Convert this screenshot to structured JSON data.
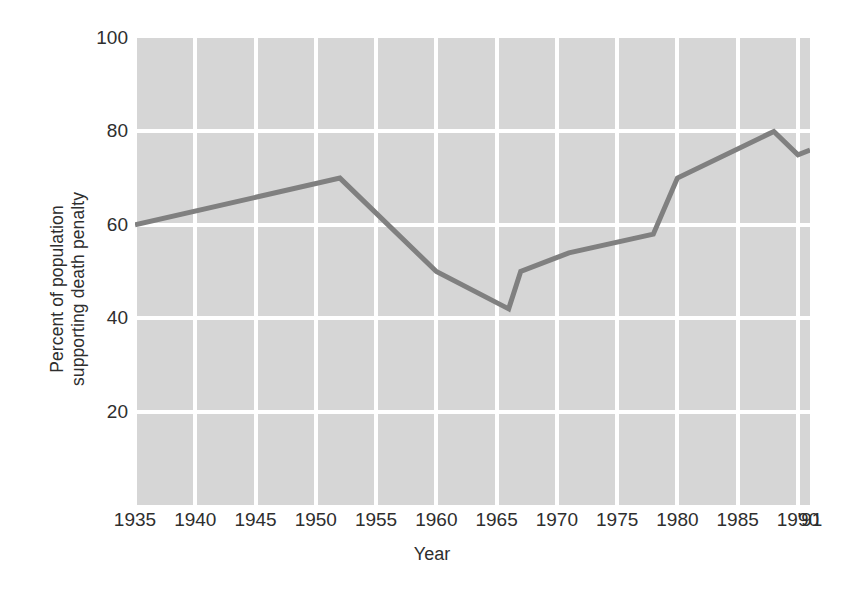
{
  "chart_data": {
    "type": "line",
    "title": "",
    "xlabel": "Year",
    "ylabel": "Percent of population supporting death penalty",
    "ylabel_lines": [
      "Percent of population",
      "supporting death penalty"
    ],
    "xlim": [
      1935,
      1991
    ],
    "ylim": [
      0,
      100
    ],
    "yticks": [
      20,
      40,
      60,
      80,
      100
    ],
    "ytick_labels": [
      "20",
      "40",
      "60",
      "80",
      "100"
    ],
    "xticks": [
      1935,
      1940,
      1945,
      1950,
      1955,
      1960,
      1965,
      1970,
      1975,
      1980,
      1985,
      1990,
      1991
    ],
    "xtick_labels": [
      "1935",
      "1940",
      "1945",
      "1950",
      "1955",
      "1960",
      "1965",
      "1970",
      "1975",
      "1980",
      "1985",
      "1990",
      "'91"
    ],
    "grid": true,
    "grid_color": "#ffffff",
    "plot_background": "#d6d6d6",
    "legend": null,
    "series": [
      {
        "name": "Percent supporting death penalty",
        "color": "#808080",
        "line_width": 5,
        "x": [
          1935,
          1952,
          1960,
          1966,
          1967,
          1971,
          1978,
          1980,
          1988,
          1990,
          1991
        ],
        "y": [
          60,
          70,
          50,
          42,
          50,
          54,
          58,
          70,
          80,
          75,
          76
        ],
        "points": [
          {
            "x": 1935,
            "y": 60
          },
          {
            "x": 1952,
            "y": 70
          },
          {
            "x": 1960,
            "y": 50
          },
          {
            "x": 1966,
            "y": 42
          },
          {
            "x": 1967,
            "y": 50
          },
          {
            "x": 1971,
            "y": 54
          },
          {
            "x": 1978,
            "y": 58
          },
          {
            "x": 1980,
            "y": 70
          },
          {
            "x": 1988,
            "y": 80
          },
          {
            "x": 1990,
            "y": 75
          },
          {
            "x": 1991,
            "y": 76
          }
        ]
      }
    ]
  }
}
